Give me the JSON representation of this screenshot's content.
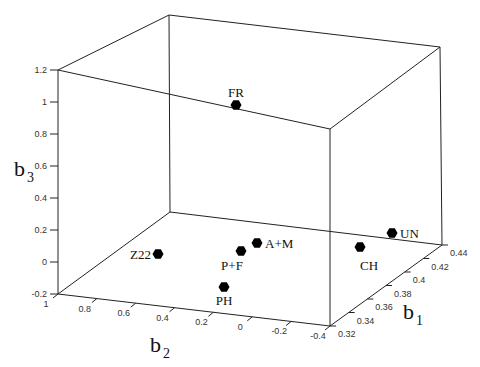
{
  "chart_data": {
    "type": "scatter3d",
    "title": "",
    "axes": {
      "x": {
        "label": "b",
        "sub": "2",
        "ticks": [
          "1",
          "0.8",
          "0.6",
          "0.4",
          "0.2",
          "0",
          "-0.2",
          "-0.4"
        ],
        "range": [
          1,
          -0.4
        ]
      },
      "y": {
        "label": "b",
        "sub": "1",
        "ticks": [
          "0.32",
          "0.34",
          "0.36",
          "0.38",
          "0.4",
          "0.42",
          "0.44"
        ],
        "range": [
          0.32,
          0.44
        ]
      },
      "z": {
        "label": "b",
        "sub": "3",
        "ticks": [
          "-0.2",
          "0",
          "0.2",
          "0.4",
          "0.6",
          "0.8",
          "1",
          "1.2"
        ],
        "range": [
          -0.2,
          1.2
        ]
      }
    },
    "grid": false,
    "legend": null,
    "points": [
      {
        "label": "FR",
        "b2": 0.12,
        "b1": 0.36,
        "b3": 1.15,
        "px": 236,
        "py": 105,
        "lx": 236,
        "ly": 97,
        "anchor": "middle"
      },
      {
        "label": "UN",
        "b2": -0.35,
        "b1": 0.43,
        "b3": 0.02,
        "px": 392,
        "py": 233,
        "lx": 400,
        "ly": 238,
        "anchor": "start"
      },
      {
        "label": "CH",
        "b2": -0.25,
        "b1": 0.4,
        "b3": 0.0,
        "px": 360,
        "py": 247,
        "lx": 369,
        "ly": 270,
        "anchor": "middle"
      },
      {
        "label": "A+M",
        "b2": 0.15,
        "b1": 0.38,
        "b3": 0.05,
        "px": 257,
        "py": 243,
        "lx": 265,
        "ly": 248,
        "anchor": "start"
      },
      {
        "label": "P+F",
        "b2": 0.2,
        "b1": 0.36,
        "b3": 0.0,
        "px": 241,
        "py": 251,
        "lx": 232,
        "ly": 270,
        "anchor": "middle"
      },
      {
        "label": "Z22",
        "b2": 0.6,
        "b1": 0.35,
        "b3": 0.05,
        "px": 158,
        "py": 254,
        "lx": 151,
        "ly": 259,
        "anchor": "end"
      },
      {
        "label": "PH",
        "b2": 0.15,
        "b1": 0.33,
        "b3": -0.1,
        "px": 224,
        "py": 287,
        "lx": 224,
        "ly": 305,
        "anchor": "middle"
      }
    ],
    "marker": {
      "shape": "hexagon",
      "color": "#000000"
    }
  }
}
